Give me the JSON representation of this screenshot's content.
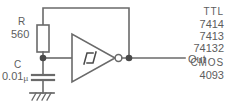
{
  "figure": {
    "stroke_color": "#6a6a6a",
    "text_color": "#5d5d5d",
    "background_color": "#ffffff"
  },
  "components": {
    "resistor": {
      "designator": "R",
      "value": "560"
    },
    "capacitor": {
      "designator": "C",
      "value": "0.01",
      "unit": "µ"
    },
    "gate": {
      "type": "schmitt-inverter",
      "symbol": "hysteresis"
    },
    "ground": {
      "type": "earth-hatched"
    }
  },
  "nodes": {
    "output_label": "Out"
  },
  "device_families": [
    {
      "name": "TTL",
      "parts": [
        "7414",
        "7413",
        "74132"
      ]
    },
    {
      "name": "CMOS",
      "parts": [
        "4093"
      ]
    }
  ]
}
